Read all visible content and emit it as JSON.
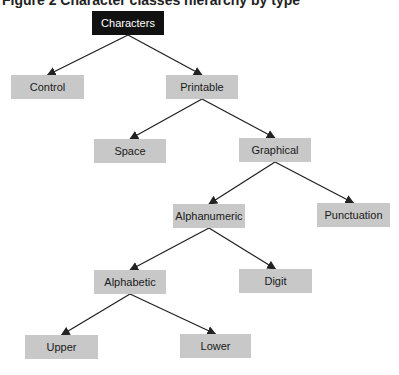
{
  "caption": "Figure 2  Character classes hierarchy by type",
  "colors": {
    "root_fill": "#111111",
    "root_text": "#ffffff",
    "node_fill": "#c8c8c8",
    "node_text": "#1a1a1a",
    "edge": "#222222"
  },
  "nodes": {
    "characters": {
      "label": "Characters",
      "x": 92,
      "y": 11,
      "w": 72
    },
    "control": {
      "label": "Control",
      "x": 11,
      "y": 75,
      "w": 73
    },
    "printable": {
      "label": "Printable",
      "x": 166,
      "y": 75,
      "w": 72
    },
    "space": {
      "label": "Space",
      "x": 94,
      "y": 139,
      "w": 72
    },
    "graphical": {
      "label": "Graphical",
      "x": 239,
      "y": 138,
      "w": 72
    },
    "alphanumeric": {
      "label": "Alphanumeric",
      "x": 173,
      "y": 204,
      "w": 72
    },
    "punctuation": {
      "label": "Punctuation",
      "x": 317,
      "y": 203,
      "w": 73
    },
    "alphabetic": {
      "label": "Alphabetic",
      "x": 94,
      "y": 270,
      "w": 72
    },
    "digit": {
      "label": "Digit",
      "x": 239,
      "y": 269,
      "w": 73
    },
    "upper": {
      "label": "Upper",
      "x": 25,
      "y": 335,
      "w": 73
    },
    "lower": {
      "label": "Lower",
      "x": 180,
      "y": 334,
      "w": 71
    }
  },
  "edges": [
    [
      "characters",
      "control"
    ],
    [
      "characters",
      "printable"
    ],
    [
      "printable",
      "space"
    ],
    [
      "printable",
      "graphical"
    ],
    [
      "graphical",
      "alphanumeric"
    ],
    [
      "graphical",
      "punctuation"
    ],
    [
      "alphanumeric",
      "alphabetic"
    ],
    [
      "alphanumeric",
      "digit"
    ],
    [
      "alphabetic",
      "upper"
    ],
    [
      "alphabetic",
      "lower"
    ]
  ]
}
